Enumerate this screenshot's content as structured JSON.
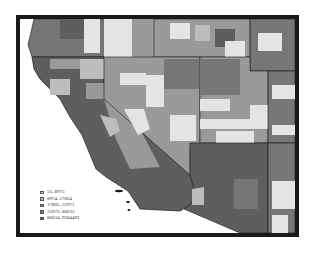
{
  "map": {
    "title": "",
    "regions": [
      "California",
      "Nevada",
      "Oregon",
      "Idaho",
      "Utah",
      "Arizona"
    ],
    "palette": {
      "class1": "#e4e4e4",
      "class2": "#bdbdbd",
      "class3": "#9a9a9a",
      "class4": "#767676",
      "class5": "#5e5e5e",
      "border": "#1a1a1a"
    }
  },
  "legend": {
    "items": [
      {
        "label": "55–8973",
        "color": "#e4e4e4"
      },
      {
        "label": "8974–17804",
        "color": "#bdbdbd"
      },
      {
        "label": "17805–33971",
        "color": "#9a9a9a"
      },
      {
        "label": "33972–80633",
        "color": "#767676"
      },
      {
        "label": "80634–9284493",
        "color": "#5e5e5e"
      }
    ]
  }
}
